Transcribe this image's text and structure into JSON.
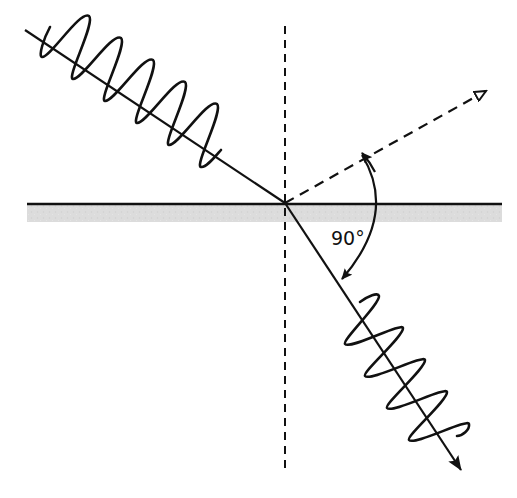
{
  "diagram": {
    "title": "",
    "colors": {
      "line": "#111111",
      "surface_band": "#d9d9d9",
      "background": "#ffffff"
    },
    "interface_point": {
      "x": 285,
      "y": 203
    },
    "surface": {
      "x1": 27,
      "x2": 502,
      "y": 204,
      "band_height": 18
    },
    "normal": {
      "x": 285,
      "y1": 26,
      "y2": 470,
      "style": "dashed"
    },
    "incident_ray": {
      "x1": 25,
      "y1": 30,
      "x2": 285,
      "y2": 203,
      "style": "solid"
    },
    "reflected_ray": {
      "x1": 285,
      "y1": 203,
      "x2": 487,
      "y2": 90,
      "style": "dashed",
      "arrowhead": "open"
    },
    "refracted_ray": {
      "x1": 285,
      "y1": 203,
      "x2": 461,
      "y2": 470,
      "style": "solid",
      "arrowhead": "filled"
    },
    "incident_wave": {
      "orientation": "vertical",
      "cycles": 5,
      "amplitude": 32
    },
    "refracted_wave": {
      "orientation": "horizontal",
      "cycles": 5,
      "amplitude": 17
    },
    "angle_arc": {
      "start": {
        "x": 362,
        "y": 152
      },
      "end": {
        "x": 341,
        "y": 281
      },
      "bulge_x": 378
    },
    "angle_label": {
      "text": "90°",
      "x": 331,
      "y": 229
    }
  }
}
